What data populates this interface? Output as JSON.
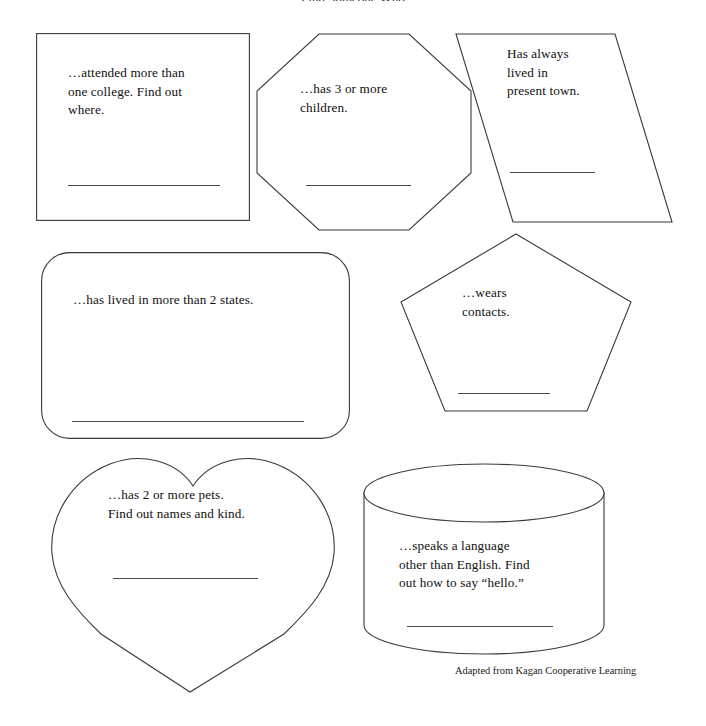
{
  "document": {
    "title_partial": "Find Someone Who",
    "footer_credit": "Adapted from Kagan Cooperative Learning"
  },
  "shapes": [
    {
      "id": "rectangle",
      "shape_name": "rectangle",
      "prompt": "…attended more than\none college. Find out\nwhere."
    },
    {
      "id": "octagon",
      "shape_name": "octagon",
      "prompt": "…has 3 or more\nchildren."
    },
    {
      "id": "parallelogram",
      "shape_name": "parallelogram",
      "prompt": "Has always\nlived in\npresent town."
    },
    {
      "id": "rounded-rectangle",
      "shape_name": "rounded-rectangle",
      "prompt": "…has lived in more than 2 states."
    },
    {
      "id": "pentagon",
      "shape_name": "pentagon",
      "prompt": "…wears\ncontacts."
    },
    {
      "id": "heart",
      "shape_name": "heart",
      "prompt": "…has 2 or more pets.\nFind out names and kind."
    },
    {
      "id": "cylinder",
      "shape_name": "cylinder",
      "prompt": "…speaks a language\nother than English. Find\nout how to say “hello.”"
    }
  ],
  "colors": {
    "outline": "#3a3a3a",
    "signature_line": "#4a4a4a",
    "text": "#101010",
    "background": "#ffffff"
  }
}
